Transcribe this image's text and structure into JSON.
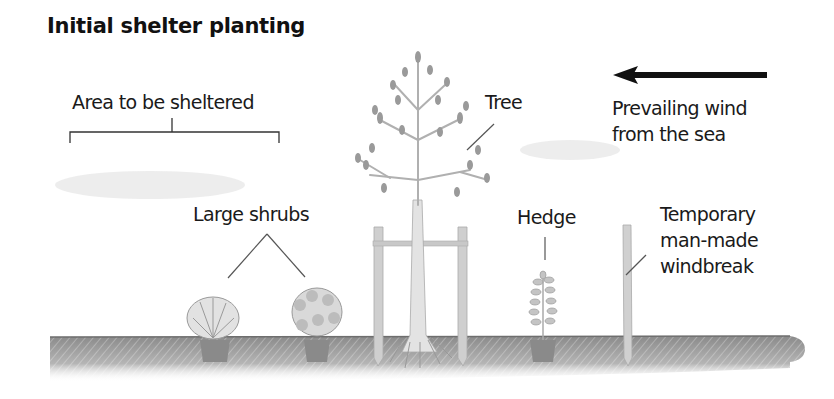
{
  "diagram": {
    "title": "Initial shelter planting",
    "labels": {
      "area": "Area to be sheltered",
      "tree": "Tree",
      "wind_line1": "Prevailing wind",
      "wind_line2": "from the sea",
      "shrubs": "Large shrubs",
      "hedge": "Hedge",
      "windbreak_line1": "Temporary",
      "windbreak_line2": "man-made",
      "windbreak_line3": "windbreak"
    },
    "arrow": {
      "direction": "left",
      "color": "#111111"
    },
    "colors": {
      "ground": "#9a9a9a",
      "plant": "#8c8c8c",
      "leader_line": "#555555",
      "text": "#1a1a1a"
    }
  }
}
